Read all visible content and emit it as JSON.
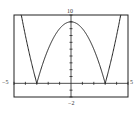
{
  "chart_data": {
    "type": "line",
    "title": "",
    "function": "y = |x^2 - 9|",
    "xlabel": "",
    "ylabel": "",
    "xlim": [
      -5,
      5
    ],
    "ylim": [
      -2,
      10
    ],
    "xscale_ticks": 1,
    "yscale_ticks": 1,
    "grid": false,
    "x": [
      -5,
      -4,
      -3,
      -2,
      -1,
      0,
      1,
      2,
      3,
      4,
      5
    ],
    "series": [
      {
        "name": "f",
        "values": [
          16,
          7,
          0,
          5,
          8,
          9,
          8,
          5,
          0,
          7,
          16
        ]
      }
    ],
    "tick_labels": {
      "xmin": "−5",
      "xmax": "5",
      "ymin": "−2",
      "ymax": "10"
    }
  }
}
